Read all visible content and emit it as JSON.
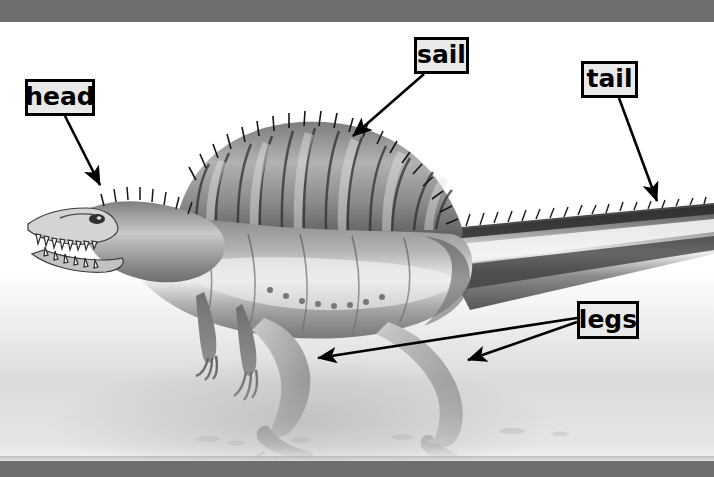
{
  "image": {
    "subject": "Spinosaurus dinosaur illustration, grayscale, side view facing left",
    "style": "labeled anatomy diagram photograph",
    "frame_color": "#6e6e6e",
    "background_color": "#ffffff"
  },
  "labels": [
    {
      "id": "head",
      "text": "head",
      "box": {
        "x": 25,
        "y": 79,
        "w": 70,
        "h": 37
      },
      "leader": {
        "from_x": 65,
        "from_y": 116,
        "to_x": 100,
        "to_y": 185
      },
      "fill": "#e9e9e9",
      "border": "#000000"
    },
    {
      "id": "sail",
      "text": "sail",
      "box": {
        "x": 414,
        "y": 37,
        "w": 55,
        "h": 37
      },
      "leader": {
        "from_x": 424,
        "from_y": 74,
        "to_x": 353,
        "to_y": 136
      },
      "fill": "#e9e9e9",
      "border": "#000000"
    },
    {
      "id": "tail",
      "text": "tail",
      "box": {
        "x": 581,
        "y": 61,
        "w": 57,
        "h": 37
      },
      "leader": {
        "from_x": 619,
        "from_y": 98,
        "to_x": 657,
        "to_y": 201
      },
      "fill": "#e9e9e9",
      "border": "#000000"
    },
    {
      "id": "legs",
      "text": "legs",
      "box": {
        "x": 577,
        "y": 301,
        "w": 62,
        "h": 38
      },
      "leaders": [
        {
          "from_x": 577,
          "from_y": 318,
          "to_x": 318,
          "to_y": 358
        },
        {
          "from_x": 577,
          "from_y": 322,
          "to_x": 468,
          "to_y": 360
        }
      ],
      "fill": "#e9e9e9",
      "border": "#000000"
    }
  ],
  "anatomy_parts": [
    "head",
    "sail",
    "tail",
    "legs"
  ],
  "frame": {
    "top_band": {
      "y": 0,
      "height": 22
    },
    "bottom_band": {
      "y": 461,
      "height": 16
    }
  }
}
